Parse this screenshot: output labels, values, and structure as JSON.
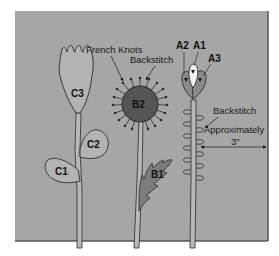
{
  "diagram": {
    "title": "",
    "colors": {
      "panel": "#a6a6a6",
      "panel_border": "#555555",
      "outline": "#2b2b2b",
      "stem_fill": "#b8b8b8",
      "tulip_fill": "#b3b3b3",
      "b2_fill": "#555555",
      "b1_leaf_fill": "#7c7c7c",
      "a_petal_fill": "#8a8a8a",
      "a1_petal_fill": "#f2f2f2",
      "arrow": "#1a1a1a"
    },
    "annotations": {
      "french_knots": "French Knots",
      "backstitch_b2": "Backstitch",
      "backstitch_a": "Backstitch",
      "approx": "Approximately",
      "measure": "3\""
    },
    "flowers": {
      "c": {
        "head": "C3",
        "leaf_upper": "C2",
        "leaf_lower": "C1"
      },
      "b": {
        "head": "B2",
        "leaf": "B1"
      },
      "a": {
        "center_petal": "A1",
        "left_petal": "A2",
        "right_petal": "A3"
      }
    }
  }
}
